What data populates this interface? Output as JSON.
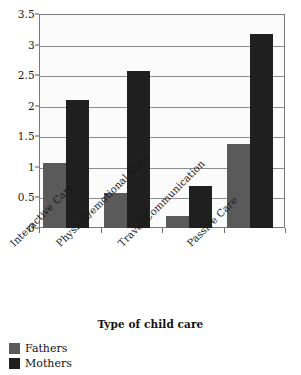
{
  "chart_data": {
    "type": "bar",
    "title": "",
    "xlabel": "Type of child care",
    "ylabel": "",
    "ylim": [
      0,
      3.5
    ],
    "ytick_labels": [
      "0",
      "0.5",
      "1",
      "1.5",
      "2",
      "2.5",
      "3",
      "3.5"
    ],
    "ytick_values": [
      0,
      0.5,
      1,
      1.5,
      2,
      2.5,
      3,
      3.5
    ],
    "grid": true,
    "legend_position": "bottom-left",
    "categories": [
      "Interactive Care",
      "Physical/emotional Care",
      "Travel/Communication",
      "Passive Care"
    ],
    "series": [
      {
        "name": "Fathers",
        "color": "#5a5a5a",
        "values": [
          1.07,
          0.58,
          0.2,
          1.38
        ]
      },
      {
        "name": "Mothers",
        "color": "#1f1f1f",
        "values": [
          2.1,
          2.57,
          0.68,
          3.18
        ]
      }
    ]
  },
  "legend": {
    "items": [
      {
        "label": "Fathers",
        "color": "#5a5a5a"
      },
      {
        "label": "Mothers",
        "color": "#1f1f1f"
      }
    ]
  }
}
